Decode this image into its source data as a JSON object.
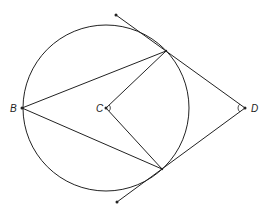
{
  "diagram": {
    "labels": {
      "B": "B",
      "C": "C",
      "D": "D"
    },
    "circle": {
      "cx": 106,
      "cy": 108,
      "r": 83
    },
    "points": {
      "B": [
        22,
        108
      ],
      "C": [
        106,
        108
      ],
      "D": [
        245,
        108
      ],
      "T1": [
        166,
        51
      ],
      "T2": [
        162,
        169
      ],
      "E1": [
        116,
        15
      ],
      "E2": [
        117,
        202
      ]
    },
    "stroke_color": "#222222"
  }
}
